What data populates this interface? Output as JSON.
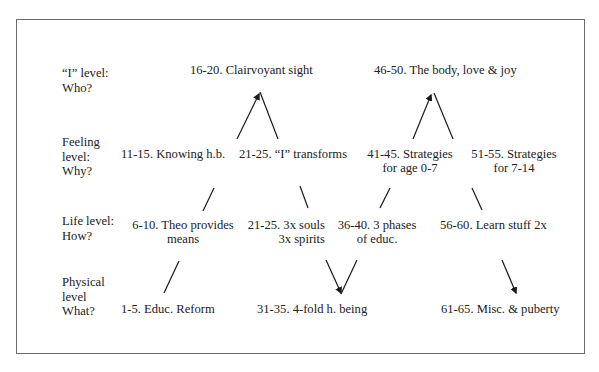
{
  "diagram": {
    "levels": [
      {
        "label": "“I” level:\nWho?"
      },
      {
        "label": "Feeling\nlevel:\nWhy?"
      },
      {
        "label": "Life level:\nHow?"
      },
      {
        "label": "Physical\nlevel\nWhat?"
      }
    ],
    "nodes": {
      "n16_20": "16-20. Clairvoyant sight",
      "n46_50": "46-50. The body, love & joy",
      "n11_15": "11-15. Knowing h.b.",
      "n21_25a": "21-25. “I” transforms",
      "n41_45_l1": "41-45. Strategies",
      "n41_45_l2": "for age 0-7",
      "n51_55_l1": "51-55. Strategies",
      "n51_55_l2": "for 7-14",
      "n6_10_l1": "6-10. Theo provides",
      "n6_10_l2": "means",
      "n21_25b_l1": "21-25. 3x souls",
      "n21_25b_l2": "3x spirits",
      "n36_40_l1": "36-40. 3 phases",
      "n36_40_l2": "of educ.",
      "n56_60": "56-60. Learn stuff 2x",
      "n1_5": "1-5. Educ. Reform",
      "n31_35": "31-35. 4-fold h. being",
      "n61_65": "61-65. Misc. & puberty"
    },
    "colors": {
      "border": "#6a6a6a",
      "text": "#222222",
      "line": "#1a1a1a"
    }
  }
}
